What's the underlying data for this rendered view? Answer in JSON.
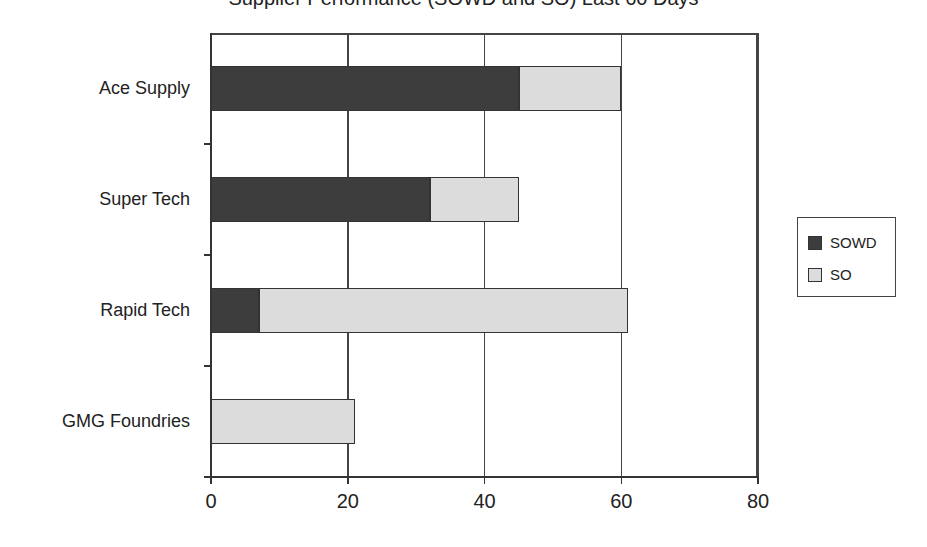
{
  "chart_data": {
    "type": "bar",
    "orientation": "horizontal",
    "stacked": true,
    "title": "Supplier Performance (SOWD and SO) Last 60 Days",
    "title_visible_fragment": "...pp... (... ...) ... ...ays",
    "categories": [
      "Ace Supply",
      "Super Tech",
      "Rapid Tech",
      "GMG Foundries"
    ],
    "series": [
      {
        "name": "SOWD",
        "color": "#3d3d3d",
        "values": [
          45,
          32,
          7,
          0
        ]
      },
      {
        "name": "SO",
        "color": "#dcdcdc",
        "values": [
          15,
          13,
          54,
          21
        ]
      }
    ],
    "totals": [
      60,
      45,
      61,
      21
    ],
    "xlabel": "",
    "ylabel": "",
    "xlim": [
      0,
      80
    ],
    "xticks": [
      0,
      20,
      40,
      60,
      80
    ],
    "grid": {
      "vertical": true,
      "horizontal": false
    },
    "legend": {
      "position": "right",
      "entries": [
        "SOWD",
        "SO"
      ]
    }
  },
  "title": "Supplier Performance (SOWD and SO) Last 60 Days",
  "axis": {
    "x_ticks": [
      "0",
      "20",
      "40",
      "60",
      "80"
    ]
  },
  "legend": {
    "items": [
      {
        "label": "SOWD",
        "color": "#3d3d3d"
      },
      {
        "label": "SO",
        "color": "#dcdcdc"
      }
    ]
  }
}
